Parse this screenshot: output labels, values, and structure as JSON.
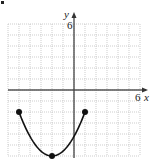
{
  "chart_data": {
    "type": "line",
    "title": "",
    "xlabel": "x",
    "ylabel": "y",
    "x_tick_label": "6",
    "y_tick_label": "6",
    "xlim": [
      -6,
      6
    ],
    "ylim": [
      -6,
      6
    ],
    "grid": true,
    "grid_step": 1,
    "series": [
      {
        "name": "parabola",
        "shape": "parabola opening upward",
        "vertex": [
          -2,
          -6
        ],
        "endpoints": [
          [
            -5,
            -2
          ],
          [
            1,
            -2
          ]
        ],
        "closed_points": [
          [
            -5,
            -2
          ],
          [
            -2,
            -6
          ],
          [
            1,
            -2
          ]
        ]
      }
    ]
  },
  "labels": {
    "y_axis": "y",
    "x_axis": "x",
    "y_max": "6",
    "x_max": "6"
  },
  "colors": {
    "curve": "#111111",
    "grid": "#b0b0b0",
    "axis": "#333333"
  }
}
